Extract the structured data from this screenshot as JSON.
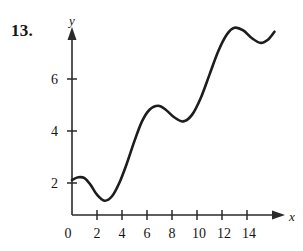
{
  "figure": {
    "problem_number": "13.",
    "x_axis_label": "x",
    "y_axis_label": "y",
    "curve_color": "#1d1d1d",
    "axis_color": "#2a2a2a",
    "background_color": "#ffffff"
  },
  "chart_data": {
    "type": "line",
    "title": "",
    "xlabel": "x",
    "ylabel": "y",
    "xlim": [
      0,
      16.6
    ],
    "ylim": [
      0,
      8.2
    ],
    "xticks": [
      0,
      2,
      4,
      6,
      8,
      10,
      12,
      14
    ],
    "xtick_labels": [
      "0",
      "2",
      "4",
      "6",
      "8",
      "10",
      "12",
      "14"
    ],
    "yticks": [
      2,
      4,
      6
    ],
    "ytick_labels": [
      "2",
      "4",
      "6"
    ],
    "grid": false,
    "legend": "none",
    "series": [
      {
        "name": "f",
        "x": [
          0.0,
          0.5,
          1.0,
          1.5,
          2.0,
          2.6,
          3.2,
          3.8,
          4.4,
          5.0,
          5.6,
          6.2,
          6.9,
          7.5,
          8.2,
          8.9,
          9.6,
          10.3,
          11.0,
          11.7,
          12.4,
          13.0,
          13.7,
          14.4,
          15.1,
          15.7,
          16.2
        ],
        "y": [
          1.35,
          1.45,
          1.42,
          1.15,
          0.78,
          0.55,
          0.72,
          1.25,
          2.0,
          2.85,
          3.6,
          4.05,
          4.2,
          4.05,
          3.75,
          3.6,
          3.85,
          4.5,
          5.4,
          6.3,
          6.95,
          7.2,
          7.1,
          6.8,
          6.62,
          6.75,
          7.05
        ]
      }
    ],
    "annotations": [
      {
        "label": "local maximum",
        "x": 1.0,
        "y": 1.45
      },
      {
        "label": "local minimum",
        "x": 2.6,
        "y": 0.55
      },
      {
        "label": "local maximum",
        "x": 6.9,
        "y": 4.2
      },
      {
        "label": "local minimum",
        "x": 8.9,
        "y": 3.6
      },
      {
        "label": "local maximum",
        "x": 13.0,
        "y": 7.2
      },
      {
        "label": "local minimum",
        "x": 15.1,
        "y": 6.62
      }
    ]
  }
}
